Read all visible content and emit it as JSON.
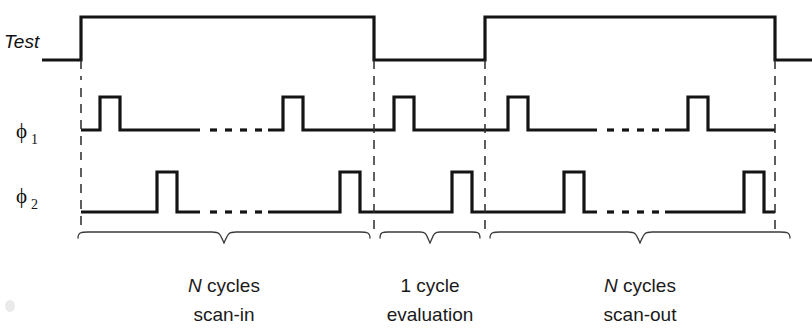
{
  "figure": {
    "type": "timing-diagram",
    "background_color": "#ffffff",
    "line_color": "#141414"
  },
  "signals": {
    "test": {
      "name": "Test",
      "label": "Test",
      "low_y": 60,
      "high_y": 17,
      "segments": [
        {
          "level": "low",
          "x_start": 42,
          "x_end": 81
        },
        {
          "level": "high",
          "x_start": 81,
          "x_end": 374
        },
        {
          "level": "low",
          "x_start": 374,
          "x_end": 485
        },
        {
          "level": "high",
          "x_start": 485,
          "x_end": 775
        },
        {
          "level": "low",
          "x_start": 775,
          "x_end": 812
        }
      ]
    },
    "phi1": {
      "name": "phi-1",
      "label": "ϕ",
      "subscript": "1",
      "baseline_y": 130,
      "pulse_top_y": 97,
      "line_start_x": 81,
      "line_end_x": 775,
      "pulses": [
        {
          "rise_x": 100,
          "fall_x": 120
        },
        {
          "rise_x": 283,
          "fall_x": 303
        },
        {
          "rise_x": 394,
          "fall_x": 414
        },
        {
          "rise_x": 508,
          "fall_x": 528
        },
        {
          "rise_x": 688,
          "fall_x": 708
        }
      ],
      "ellipses": [
        {
          "x_start": 206,
          "x_end": 258,
          "dots": 4
        },
        {
          "x_start": 603,
          "x_end": 655,
          "dots": 4
        }
      ]
    },
    "phi2": {
      "name": "phi-2",
      "label": "ϕ",
      "subscript": "2",
      "baseline_y": 212,
      "pulse_top_y": 172,
      "line_start_x": 81,
      "line_end_x": 775,
      "pulses": [
        {
          "rise_x": 157,
          "fall_x": 177
        },
        {
          "rise_x": 340,
          "fall_x": 360
        },
        {
          "rise_x": 452,
          "fall_x": 472
        },
        {
          "rise_x": 564,
          "fall_x": 584
        },
        {
          "rise_x": 744,
          "fall_x": 764
        }
      ],
      "ellipses": [
        {
          "x_start": 206,
          "x_end": 258,
          "dots": 4
        },
        {
          "x_start": 603,
          "x_end": 655,
          "dots": 4
        }
      ]
    }
  },
  "separators": [
    {
      "name": "scan-in-evaluation-boundary",
      "x": 374,
      "y_top": 60,
      "y_bottom": 228
    },
    {
      "name": "evaluation-scan-out-boundary",
      "x": 485,
      "y_top": 60,
      "y_bottom": 228
    },
    {
      "name": "start-boundary",
      "x": 81,
      "y_top": 60,
      "y_bottom": 228
    },
    {
      "name": "end-boundary",
      "x": 775,
      "y_top": 60,
      "y_bottom": 228
    }
  ],
  "phases": [
    {
      "name": "scan-in",
      "brace_x_start": 78,
      "brace_x_end": 370,
      "line1_prefix_italic": "N",
      "line1": "N cycles",
      "line1_rest": " cycles",
      "line2": "scan-in",
      "center_x": 224
    },
    {
      "name": "evaluation",
      "brace_x_start": 380,
      "brace_x_end": 480,
      "line1_prefix_italic": "",
      "line1": "1 cycle",
      "line1_rest": "1 cycle",
      "line2": "evaluation",
      "center_x": 430
    },
    {
      "name": "scan-out",
      "brace_x_start": 490,
      "brace_x_end": 790,
      "line1_prefix_italic": "N",
      "line1": "N cycles",
      "line1_rest": " cycles",
      "line2": "scan-out",
      "center_x": 640
    }
  ],
  "caption_rows": {
    "line1_y": 292,
    "line2_y": 321
  }
}
